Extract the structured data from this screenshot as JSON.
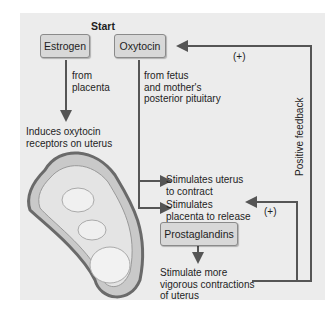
{
  "diagram": {
    "start_label": "Start",
    "boxes": {
      "estrogen": "Estrogen",
      "oxytocin": "Oxytocin",
      "prostaglandins": "Prostaglandins"
    },
    "texts": {
      "from_placenta": "from\nplacenta",
      "induces": "Induces oxytocin\nreceptors on uterus",
      "from_fetus": "from fetus\nand mother's\nposterior pituitary",
      "stim_uterus": "Stimulates uterus\nto contract",
      "stim_placenta": "Stimulates\nplacenta to release",
      "stim_more": "Stimulate more\nvigorous contractions\nof uterus"
    },
    "plus_top": "(+)",
    "plus_bottom": "(+)",
    "feedback_label": "Positive feedback",
    "image": "fetus-in-uterus-illustration",
    "colors": {
      "panel": "#ececec",
      "box": "#d8d8d8",
      "line": "#555555"
    }
  }
}
